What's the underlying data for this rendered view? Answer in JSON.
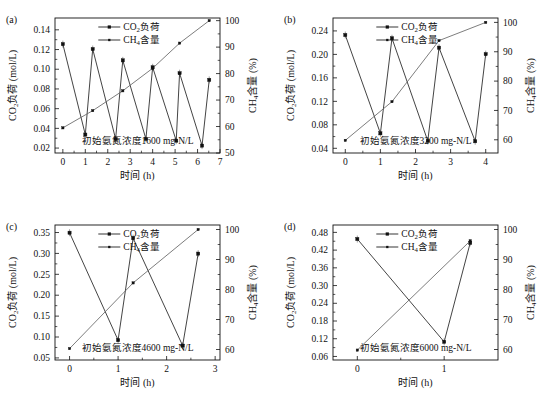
{
  "figure": {
    "panels": [
      {
        "tag": "(a)",
        "annotation": "初始氨氮浓度1600 mg-N/L",
        "chart_data": {
          "type": "line",
          "title": "",
          "xlabel": "时间 (h)",
          "ylabel": "CO₂负荷 (mol/L)",
          "y2label": "CH₄含量 (%)",
          "xlim": [
            -0.35,
            7
          ],
          "ylim": [
            0.015,
            0.152
          ],
          "y2lim": [
            50,
            101
          ],
          "xticks": [
            0,
            1,
            2,
            3,
            4,
            5,
            6,
            7
          ],
          "yticks": [
            0.02,
            0.04,
            0.06,
            0.08,
            0.1,
            0.12,
            0.14
          ],
          "ytick_labels": [
            "0.02",
            "0.04",
            "0.06",
            "0.08",
            "0.10",
            "0.12",
            "0.14"
          ],
          "y2ticks": [
            50,
            60,
            70,
            80,
            90,
            100
          ],
          "grid": false,
          "legend_position": "top-center",
          "series": [
            {
              "name": "CO₂负荷",
              "axis": "left",
              "marker": "square",
              "x": [
                0,
                1.0,
                1.33,
                2.35,
                2.67,
                3.7,
                4.0,
                5.05,
                5.2,
                6.2,
                6.52
              ],
              "values": [
                0.1255,
                0.0337,
                0.1205,
                0.0293,
                0.109,
                0.0293,
                0.102,
                0.0275,
                0.096,
                0.0225,
                0.0892
              ]
            },
            {
              "name": "CH₄含量",
              "axis": "right",
              "marker": "square-small",
              "x": [
                0,
                1.33,
                2.67,
                4.0,
                5.2,
                6.52
              ],
              "values": [
                59.5,
                66.0,
                73.5,
                82.0,
                91.5,
                100.0
              ]
            }
          ]
        }
      },
      {
        "tag": "(b)",
        "annotation": "初始氨氮浓度3200 mg-N/L",
        "chart_data": {
          "type": "line",
          "title": "",
          "xlabel": "时间 (h)",
          "ylabel": "CO₂负荷 (mol/L)",
          "y2label": "CH₄含量 (%)",
          "xlim": [
            -0.35,
            4.35
          ],
          "ylim": [
            0.032,
            0.262
          ],
          "y2lim": [
            55.5,
            101.5
          ],
          "xticks": [
            0,
            1,
            2,
            3,
            4
          ],
          "yticks": [
            0.04,
            0.08,
            0.12,
            0.16,
            0.2,
            0.24
          ],
          "ytick_labels": [
            "0.04",
            "0.08",
            "0.12",
            "0.16",
            "0.20",
            "0.24"
          ],
          "y2ticks": [
            60,
            70,
            80,
            90,
            100
          ],
          "grid": false,
          "legend_position": "top-center",
          "series": [
            {
              "name": "CO₂负荷",
              "axis": "left",
              "marker": "square",
              "x": [
                0,
                1.0,
                1.33,
                2.35,
                2.67,
                3.7,
                4.0
              ],
              "values": [
                0.233,
                0.0655,
                0.2275,
                0.0525,
                0.2115,
                0.052,
                0.2005
              ]
            },
            {
              "name": "CH₄含量",
              "axis": "right",
              "marker": "square-small",
              "x": [
                0,
                1.33,
                2.67,
                4.0
              ],
              "values": [
                59.8,
                73.0,
                93.8,
                100.0
              ]
            }
          ]
        }
      },
      {
        "tag": "(c)",
        "annotation": "初始氨氮浓度4600 mg-N/L",
        "chart_data": {
          "type": "line",
          "title": "",
          "xlabel": "时间 (h)",
          "ylabel": "CO₂负荷 (mol/L)",
          "y2label": "CH₄含量 (%)",
          "xlim": [
            -0.3,
            3.1
          ],
          "ylim": [
            0.045,
            0.368
          ],
          "y2lim": [
            56.5,
            101.5
          ],
          "xticks": [
            0,
            1,
            2,
            3
          ],
          "yticks": [
            0.05,
            0.1,
            0.15,
            0.2,
            0.25,
            0.3,
            0.35
          ],
          "ytick_labels": [
            "0.05",
            "0.10",
            "0.15",
            "0.20",
            "0.25",
            "0.30",
            "0.35"
          ],
          "y2ticks": [
            60,
            70,
            80,
            90,
            100
          ],
          "grid": false,
          "legend_position": "top-center",
          "series": [
            {
              "name": "CO₂负荷",
              "axis": "left",
              "marker": "square",
              "x": [
                0,
                1.0,
                1.31,
                2.33,
                2.65
              ],
              "values": [
                0.3495,
                0.0925,
                0.3365,
                0.0795,
                0.2995
              ]
            },
            {
              "name": "CH₄含量",
              "axis": "right",
              "marker": "square-small",
              "x": [
                0,
                1.31,
                2.65
              ],
              "values": [
                60.3,
                82.2,
                100.0
              ]
            }
          ]
        }
      },
      {
        "tag": "(d)",
        "annotation": "初始氨氮浓度6000 mg-N/L",
        "chart_data": {
          "type": "line",
          "title": "",
          "xlabel": "时间 (h)",
          "ylabel": "CO₂负荷 (mol/L)",
          "y2label": "CH₄含量 (%)",
          "xlim": [
            -0.28,
            1.62
          ],
          "ylim": [
            0.048,
            0.505
          ],
          "y2lim": [
            56.5,
            101.5
          ],
          "xticks": [
            0,
            1
          ],
          "yticks": [
            0.06,
            0.12,
            0.18,
            0.24,
            0.3,
            0.36,
            0.42,
            0.48
          ],
          "ytick_labels": [
            "0.06",
            "0.12",
            "0.18",
            "0.24",
            "0.30",
            "0.36",
            "0.42",
            "0.48"
          ],
          "y2ticks": [
            60,
            70,
            80,
            90,
            100
          ],
          "grid": false,
          "legend_position": "top-center",
          "series": [
            {
              "name": "CO₂负荷",
              "axis": "left",
              "marker": "square",
              "x": [
                0,
                1.0,
                1.3
              ],
              "values": [
                0.4575,
                0.1095,
                0.4445
              ]
            },
            {
              "name": "CH₄含量",
              "axis": "right",
              "marker": "square-small",
              "x": [
                0,
                1.3
              ],
              "values": [
                59.8,
                96.2
              ]
            }
          ]
        }
      }
    ],
    "legend": {
      "co2_label_main": "CO",
      "co2_label_sub": "2",
      "co2_label_tail": "负荷",
      "ch4_label_main": "CH",
      "ch4_label_sub": "4",
      "ch4_label_tail": "含量"
    },
    "axis_text": {
      "x_title": "时间 (h)",
      "y_left_main": "CO",
      "y_left_sub": "2",
      "y_left_tail": "负荷 (mol/L)",
      "y_right_main": "CH",
      "y_right_sub": "4",
      "y_right_tail": "含量 (%)"
    },
    "colors": {
      "line": "#222222",
      "ch4_line": "#666666",
      "axis": "#111111",
      "background": "#ffffff"
    }
  }
}
